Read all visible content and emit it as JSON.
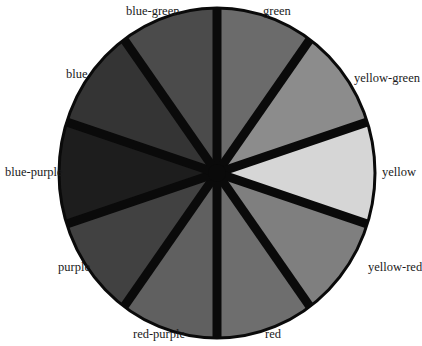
{
  "diagram": {
    "type": "color-wheel",
    "center": {
      "x": 217,
      "y": 173
    },
    "radius": {
      "rx": 158,
      "ry": 165
    },
    "spoke_color": "#0a0a0a",
    "rim_color": "#0a0a0a",
    "segments": [
      {
        "name": "green",
        "fill": "#6b6b6b",
        "start_deg": -90,
        "end_deg": -54
      },
      {
        "name": "yellow-green",
        "fill": "#8c8c8c",
        "start_deg": -54,
        "end_deg": -18
      },
      {
        "name": "yellow",
        "fill": "#d6d6d6",
        "start_deg": -18,
        "end_deg": 18
      },
      {
        "name": "yellow-red",
        "fill": "#7f7f7f",
        "start_deg": 18,
        "end_deg": 54
      },
      {
        "name": "red",
        "fill": "#6e6e6e",
        "start_deg": 54,
        "end_deg": 90
      },
      {
        "name": "red-purple",
        "fill": "#606060",
        "start_deg": 90,
        "end_deg": 126
      },
      {
        "name": "purple",
        "fill": "#414141",
        "start_deg": 126,
        "end_deg": 162
      },
      {
        "name": "blue-purple",
        "fill": "#1d1d1d",
        "start_deg": 162,
        "end_deg": 198
      },
      {
        "name": "blue",
        "fill": "#343434",
        "start_deg": 198,
        "end_deg": 234
      },
      {
        "name": "blue-green",
        "fill": "#4b4b4b",
        "start_deg": 234,
        "end_deg": 270
      }
    ],
    "labels": {
      "green": "green",
      "yellow_green": "yellow-green",
      "yellow": "yellow",
      "yellow_red": "yellow-red",
      "red": "red",
      "red_purple": "red-purple",
      "purple": "purple",
      "blue_purple": "blue-purple",
      "blue": "blue",
      "blue_green": "blue-green"
    }
  }
}
